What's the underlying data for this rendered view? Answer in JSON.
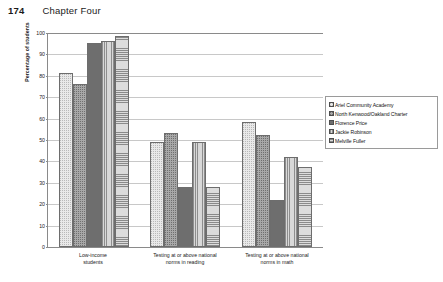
{
  "page": {
    "folio": "174",
    "chapter_title": "Chapter Four"
  },
  "chart_data": {
    "type": "bar",
    "title": "",
    "xlabel": "",
    "ylabel": "Percentage of students",
    "ylim": [
      0,
      100
    ],
    "ytick_step": 10,
    "yticks": [
      "0",
      "10",
      "20",
      "30",
      "40",
      "50",
      "60",
      "70",
      "80",
      "90",
      "100"
    ],
    "grid": true,
    "legend_position": "right",
    "categories": [
      "Low-income students",
      "Testing at or above national norms in reading",
      "Testing at or above national norms in math"
    ],
    "category_lines": [
      [
        "Low-income",
        "students"
      ],
      [
        "Testing at or above national",
        "norms in reading"
      ],
      [
        "Testing at or above national",
        "norms in math"
      ]
    ],
    "series": [
      {
        "name": "Ariel Community Academy",
        "pattern": "light-dotted",
        "values": [
          81,
          49,
          58
        ]
      },
      {
        "name": "North Kenwood/Oakland Charter",
        "pattern": "medium-dotted",
        "values": [
          76,
          53,
          52
        ]
      },
      {
        "name": "Florence Price",
        "pattern": "solid-gray",
        "values": [
          95,
          28,
          22
        ]
      },
      {
        "name": "Jackie Robinson",
        "pattern": "vertical-lines",
        "values": [
          96,
          49,
          42
        ]
      },
      {
        "name": "Melville Fuller",
        "pattern": "horizontal-lines",
        "values": [
          98,
          28,
          37
        ]
      }
    ]
  }
}
